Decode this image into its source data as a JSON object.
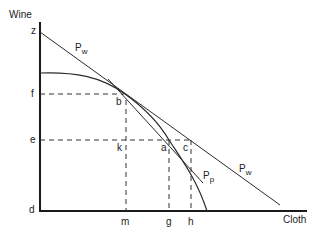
{
  "diagram": {
    "type": "production possibility frontier with trade price lines",
    "axes": {
      "y_label": "Wine",
      "x_label": "Cloth"
    },
    "y_points": [
      "z",
      "f",
      "e",
      "d"
    ],
    "x_points": [
      "m",
      "g",
      "h"
    ],
    "points": [
      "b",
      "k",
      "a",
      "c"
    ],
    "lines": [
      {
        "name": "P",
        "subscript": "w"
      },
      {
        "name": "P",
        "subscript": "w"
      },
      {
        "name": "P",
        "subscript": "p"
      }
    ]
  },
  "labels": {
    "wine": "Wine",
    "cloth": "Cloth",
    "z": "z",
    "f": "f",
    "e": "e",
    "d": "d",
    "m": "m",
    "g": "g",
    "h": "h",
    "b": "b",
    "k": "k",
    "a": "a",
    "c": "c",
    "pw_main": "P",
    "pw_sub": "w",
    "pp_main": "P",
    "pp_sub": "p"
  },
  "colors": {
    "line": "#2a2a2a",
    "axis": "#1a1a1a"
  }
}
